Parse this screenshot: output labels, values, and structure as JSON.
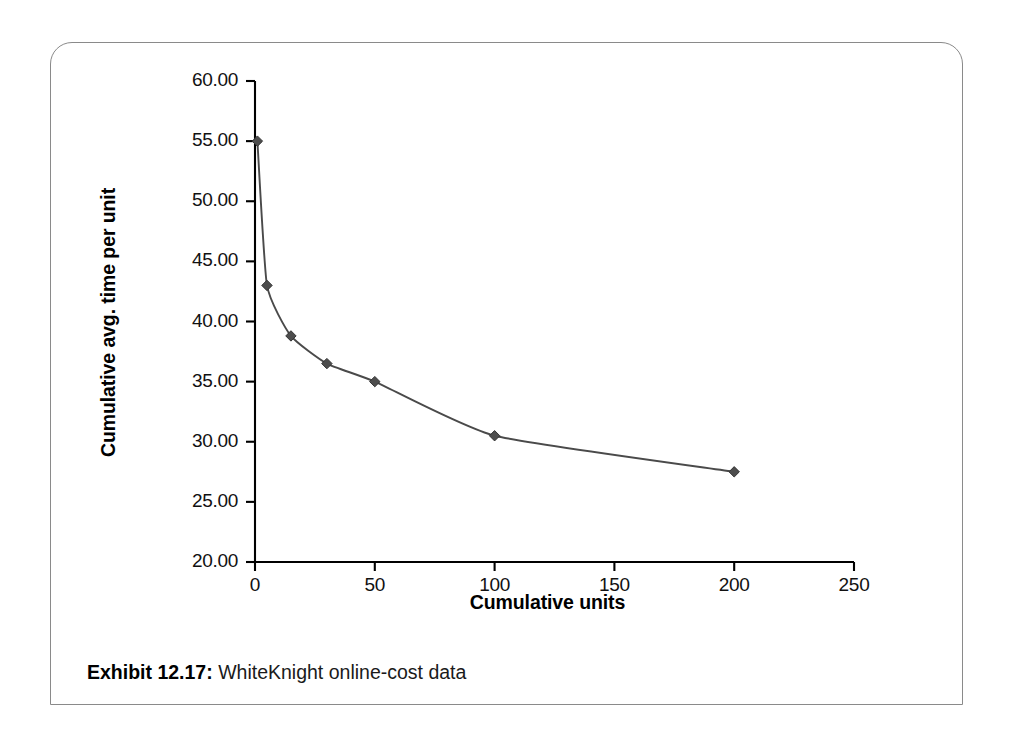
{
  "exhibit": {
    "caption_label": "Exhibit 12.17:",
    "caption_text": "WhiteKnight online-cost data"
  },
  "chart_data": {
    "type": "line",
    "title": "",
    "xlabel": "Cumulative units",
    "ylabel": "Cumulative avg. time per unit",
    "xlim": [
      0,
      250
    ],
    "ylim": [
      20.0,
      60.0
    ],
    "xticks": [
      0,
      50,
      100,
      150,
      200,
      250
    ],
    "xtick_labels": [
      "0",
      "50",
      "100",
      "150",
      "200",
      "250"
    ],
    "yticks": [
      20.0,
      25.0,
      30.0,
      35.0,
      40.0,
      45.0,
      50.0,
      55.0,
      60.0
    ],
    "ytick_labels": [
      "20.00",
      "25.00",
      "30.00",
      "35.00",
      "40.00",
      "45.00",
      "50.00",
      "55.00",
      "60.00"
    ],
    "grid": false,
    "legend": false,
    "marker": "diamond",
    "line_color": "#4a4a4a",
    "marker_color": "#4d4d4d",
    "axis_color": "#000000",
    "series": [
      {
        "name": "Cumulative avg. time per unit",
        "x": [
          1,
          5,
          15,
          30,
          50,
          100,
          200
        ],
        "y": [
          55.0,
          43.0,
          38.8,
          36.5,
          35.0,
          30.5,
          27.5
        ]
      }
    ]
  }
}
